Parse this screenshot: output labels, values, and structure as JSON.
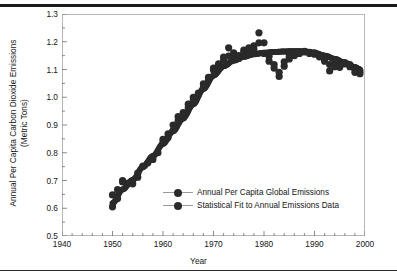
{
  "figure": {
    "y_axis_title_line1": "Annual Per Capita Carbon Dioxide Emissions",
    "y_axis_title_line2": "(Metric Tons)",
    "x_axis_title": "Year"
  },
  "legend": {
    "items": [
      {
        "label": "Annual Per Capita Global Emissions",
        "marker": "filled-circle",
        "color": "#2a2a2a"
      },
      {
        "label": "Statistical Fit to Annual Emissions Data",
        "marker": "filled-circle",
        "color": "#2a2a2a"
      }
    ]
  },
  "chart_data": {
    "type": "scatter",
    "title": "",
    "subtitle": "",
    "xlabel": "Year",
    "ylabel": "Annual Per Capita Carbon Dioxide Emissions (Metric Tons)",
    "xlim": [
      1940,
      2000
    ],
    "ylim": [
      0.5,
      1.3
    ],
    "xticks": [
      1940,
      1950,
      1960,
      1970,
      1980,
      1990,
      2000
    ],
    "xtick_labels": [
      "1940",
      "1950",
      "1960",
      "1970",
      "1980",
      "1990",
      "2000"
    ],
    "x_minor_tick_step": 2,
    "yticks": [
      0.5,
      0.6,
      0.7,
      0.8,
      0.9,
      1.0,
      1.1,
      1.2,
      1.3
    ],
    "ytick_labels": [
      "0.5",
      "0.6",
      "0.7",
      "0.8",
      "0.9",
      "1.0",
      "1.1",
      "1.2",
      "1.3"
    ],
    "y_minor_tick_step": 0.05,
    "grid": false,
    "legend_position": "center",
    "marker_color": "#2a2a2a",
    "marker_size_px": 7.2,
    "series": [
      {
        "name": "Annual Per Capita Global Emissions",
        "type": "scatter",
        "x": [
          1950,
          1950,
          1951,
          1951,
          1952,
          1952,
          1953,
          1954,
          1955,
          1955,
          1956,
          1957,
          1958,
          1959,
          1960,
          1960,
          1961,
          1961,
          1962,
          1962,
          1963,
          1963,
          1964,
          1964,
          1965,
          1965,
          1966,
          1966,
          1967,
          1967,
          1968,
          1968,
          1969,
          1969,
          1970,
          1970,
          1971,
          1971,
          1972,
          1972,
          1973,
          1973,
          1974,
          1974,
          1975,
          1975,
          1976,
          1976,
          1977,
          1977,
          1978,
          1978,
          1979,
          1979,
          1980,
          1980,
          1981,
          1981,
          1982,
          1982,
          1983,
          1983,
          1984,
          1984,
          1985,
          1985,
          1986,
          1986,
          1987,
          1987,
          1988,
          1988,
          1989,
          1989,
          1990,
          1990,
          1991,
          1991,
          1992,
          1992,
          1993,
          1993,
          1994,
          1994,
          1995,
          1995,
          1996,
          1996,
          1997,
          1997,
          1998,
          1998,
          1999,
          1999
        ],
        "y": [
          0.605,
          0.648,
          0.635,
          0.667,
          0.695,
          0.7,
          0.69,
          0.688,
          0.712,
          0.727,
          0.752,
          0.764,
          0.776,
          0.8,
          0.838,
          0.848,
          0.855,
          0.868,
          0.88,
          0.9,
          0.915,
          0.93,
          0.925,
          0.945,
          0.962,
          0.975,
          0.99,
          1.0,
          1.01,
          1.015,
          1.035,
          1.048,
          1.062,
          1.072,
          1.098,
          1.105,
          1.112,
          1.12,
          1.135,
          1.145,
          1.178,
          1.148,
          1.152,
          1.16,
          1.14,
          1.15,
          1.162,
          1.17,
          1.178,
          1.158,
          1.185,
          1.172,
          1.232,
          1.196,
          1.196,
          1.158,
          1.148,
          1.13,
          1.118,
          1.105,
          1.075,
          1.09,
          1.112,
          1.128,
          1.138,
          1.148,
          1.15,
          1.155,
          1.158,
          1.16,
          1.163,
          1.165,
          1.162,
          1.158,
          1.16,
          1.155,
          1.15,
          1.145,
          1.138,
          1.13,
          1.095,
          1.118,
          1.11,
          1.122,
          1.108,
          1.118,
          1.12,
          1.125,
          1.118,
          1.11,
          1.09,
          1.1,
          1.085,
          1.095
        ]
      },
      {
        "name": "Statistical Fit to Annual Emissions Data",
        "type": "line",
        "x": [
          1950,
          1952,
          1954,
          1956,
          1958,
          1960,
          1962,
          1964,
          1966,
          1968,
          1970,
          1972,
          1974,
          1976,
          1978,
          1980,
          1982,
          1984,
          1986,
          1988,
          1990,
          1992,
          1994,
          1996,
          1998,
          1999
        ],
        "y": [
          0.618,
          0.668,
          0.702,
          0.748,
          0.788,
          0.832,
          0.878,
          0.925,
          0.975,
          1.03,
          1.078,
          1.112,
          1.132,
          1.146,
          1.155,
          1.16,
          1.163,
          1.165,
          1.166,
          1.165,
          1.16,
          1.15,
          1.138,
          1.124,
          1.108,
          1.1
        ]
      }
    ]
  }
}
